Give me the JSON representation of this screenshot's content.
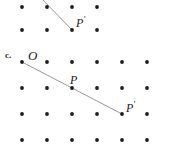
{
  "figure": {
    "background_color": "#ffffff",
    "dot_color": "#1c1c1c",
    "line_color": "#8a8a8a",
    "label_color": "#1a1a1a",
    "dot_radius": 1.9,
    "width": 175,
    "height": 151
  },
  "part_label": {
    "text": "c.",
    "x": 5,
    "y": 51
  },
  "panels": [
    {
      "id": "upper-partial",
      "name": "upper-partial-panel",
      "description": "Bottom portion of the preceding figure, cropped at top of image",
      "grid": {
        "columns_x": [
          22,
          47,
          72,
          97
        ],
        "rows_y": [
          7,
          30
        ]
      },
      "dots": [
        {
          "x": 22,
          "y": 7
        },
        {
          "x": 47,
          "y": 7
        },
        {
          "x": 72,
          "y": 7
        },
        {
          "x": 97,
          "y": 7
        },
        {
          "x": 22,
          "y": 30
        },
        {
          "x": 47,
          "y": 30
        },
        {
          "x": 72,
          "y": 30
        },
        {
          "x": 97,
          "y": 30
        }
      ],
      "segments": [
        {
          "name": "ray-to-P-prime",
          "x1": 43,
          "y1": 0,
          "x2": 72,
          "y2": 30
        }
      ],
      "labels": [
        {
          "id": "upper-p-prime",
          "text": "P",
          "prime": true,
          "x": 76,
          "y": 15
        }
      ]
    },
    {
      "id": "part-c",
      "name": "part-c-panel",
      "description": "Dot grid with ray from O through P to P prime",
      "grid": {
        "columns_x": [
          22,
          47,
          72,
          97,
          122,
          147
        ],
        "rows_y": [
          62,
          88,
          114,
          140
        ]
      },
      "dots": [
        {
          "x": 22,
          "y": 62
        },
        {
          "x": 47,
          "y": 62
        },
        {
          "x": 72,
          "y": 62
        },
        {
          "x": 97,
          "y": 62
        },
        {
          "x": 122,
          "y": 62
        },
        {
          "x": 147,
          "y": 62
        },
        {
          "x": 22,
          "y": 88
        },
        {
          "x": 47,
          "y": 88
        },
        {
          "x": 72,
          "y": 88
        },
        {
          "x": 97,
          "y": 88
        },
        {
          "x": 122,
          "y": 88
        },
        {
          "x": 147,
          "y": 88
        },
        {
          "x": 22,
          "y": 114
        },
        {
          "x": 47,
          "y": 114
        },
        {
          "x": 72,
          "y": 114
        },
        {
          "x": 97,
          "y": 114
        },
        {
          "x": 122,
          "y": 114
        },
        {
          "x": 147,
          "y": 114
        },
        {
          "x": 22,
          "y": 140
        },
        {
          "x": 47,
          "y": 140
        },
        {
          "x": 72,
          "y": 140
        },
        {
          "x": 97,
          "y": 140
        },
        {
          "x": 122,
          "y": 140
        },
        {
          "x": 147,
          "y": 140
        }
      ],
      "segments": [
        {
          "name": "ray-O-to-P-prime",
          "x1": 22,
          "y1": 62,
          "x2": 122,
          "y2": 114
        }
      ],
      "points_of_interest": [
        {
          "id": "point-O",
          "label": "O",
          "prime": false,
          "x": 22,
          "y": 62
        },
        {
          "id": "point-P",
          "label": "P",
          "prime": false,
          "x": 72,
          "y": 88
        },
        {
          "id": "point-P-prime",
          "label": "P",
          "prime": true,
          "x": 122,
          "y": 114
        }
      ],
      "labels": [
        {
          "id": "label-O",
          "text": "O",
          "prime": false,
          "x": 28,
          "y": 49
        },
        {
          "id": "label-P",
          "text": "P",
          "prime": false,
          "x": 70,
          "y": 74
        },
        {
          "id": "label-P-prime",
          "text": "P",
          "prime": true,
          "x": 126,
          "y": 100
        }
      ]
    }
  ]
}
